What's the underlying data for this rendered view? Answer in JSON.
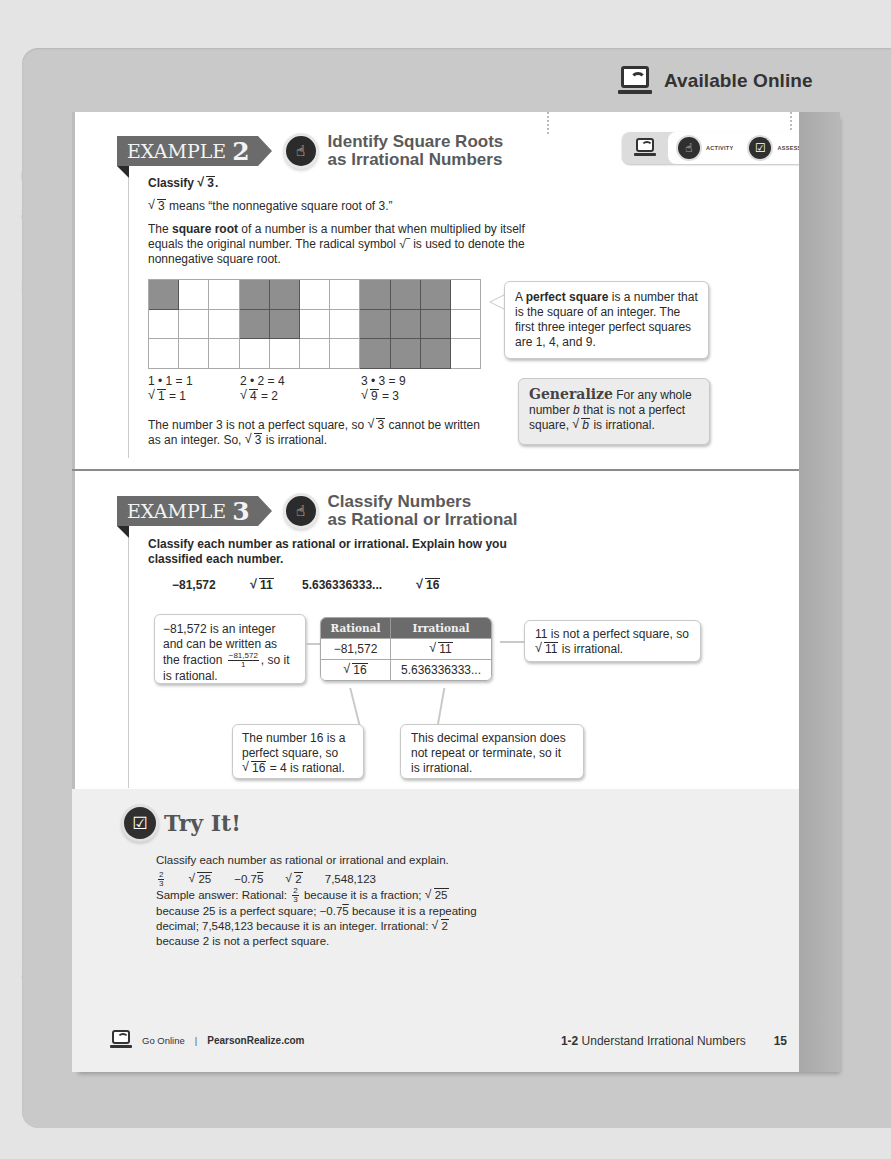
{
  "background_ghost_text": [
    "",
    "",
    "",
    "",
    "example a decimal place that does not terminate or repeat, the",
    "ample for any whole numbers that the following",
    "",
    "Understand Irrational Numbers",
    "",
    "",
    "",
    "",
    "",
    "",
    "",
    "",
    "",
    "",
    "",
    "",
    "",
    "",
    "",
    "",
    "",
    "Student Misconception",
    ""
  ],
  "header": {
    "available_online_label": "Available Online",
    "online_toolbar": {
      "items": [
        {
          "icon": "laptop-wifi-icon",
          "label": ""
        },
        {
          "icon": "hand-pointer-icon",
          "label": "ACTIVITY"
        },
        {
          "icon": "check-box-icon",
          "label": "ASSESS"
        }
      ]
    }
  },
  "example2": {
    "tag_word": "EXAMPLE",
    "tag_number": "2",
    "title_line1": "Identify Square Roots",
    "title_line2": "as Irrational Numbers",
    "prompt_pre": "Classify ",
    "prompt_rad": "3",
    "prompt_post": ".",
    "line1_rad": "3",
    "line1_post": " means “the nonnegative square root of 3.”",
    "def_pre": "The ",
    "def_term": "square root",
    "def_mid": " of a number is a number that when multiplied by itself equals the original number. The radical symbol ",
    "def_symbol": "√‾",
    "def_post": " is used to denote the nonnegative square root.",
    "grid": {
      "cols": 11,
      "rows": 3,
      "shaded": [
        [
          0,
          0
        ],
        [
          0,
          3
        ],
        [
          0,
          4
        ],
        [
          1,
          3
        ],
        [
          1,
          4
        ],
        [
          0,
          7
        ],
        [
          0,
          8
        ],
        [
          0,
          9
        ],
        [
          1,
          7
        ],
        [
          1,
          8
        ],
        [
          1,
          9
        ],
        [
          2,
          7
        ],
        [
          2,
          8
        ],
        [
          2,
          9
        ]
      ]
    },
    "products": [
      {
        "eq": "1 • 1 = 1",
        "rad": "1",
        "result": " = 1"
      },
      {
        "eq": "2 • 2 = 4",
        "rad": "4",
        "result": " = 2"
      },
      {
        "eq": "3 • 3 = 9",
        "rad": "9",
        "result": " = 3"
      }
    ],
    "conclusion_a": "The number 3 is not a perfect square, so ",
    "conclusion_rad1": "3",
    "conclusion_b": " cannot be written as an integer. So, ",
    "conclusion_rad2": "3",
    "conclusion_c": " is irrational.",
    "perfect_square_callout": {
      "pre": "A ",
      "term": "perfect square",
      "post": " is a number that is the square of an integer. The first three integer perfect squares are 1, 4, and 9."
    },
    "generalize_callout": {
      "word": "Generalize",
      "text_a": " For any whole number ",
      "var": "b",
      "text_b": " that is not a perfect square, ",
      "rad": "b",
      "text_c": " is irrational."
    }
  },
  "example3": {
    "tag_word": "EXAMPLE",
    "tag_number": "3",
    "title_line1": "Classify Numbers",
    "title_line2": "as Rational or Irrational",
    "prompt": "Classify each number as rational or irrational. Explain how you classified each number.",
    "numbers": {
      "n1": "−81,572",
      "n2_rad": "11",
      "n3": "5.636336333...",
      "n4_rad": "16"
    },
    "table": {
      "headers": [
        "Rational",
        "Irrational"
      ],
      "rows": [
        {
          "rational": "−81,572",
          "rational_is_rad": false,
          "irrational": "11",
          "irrational_is_rad": true
        },
        {
          "rational": "16",
          "rational_is_rad": true,
          "irrational": "5.636336333...",
          "irrational_is_rad": false
        }
      ]
    },
    "callout_integer": {
      "text_a": "−81,572 is an integer and can be written as the fraction ",
      "frac_num": "−81,572",
      "frac_den": "1",
      "text_b": ", so it is rational."
    },
    "callout_sqrt11": {
      "text_a": "11 is not a perfect square, so ",
      "rad": "11",
      "text_b": " is irrational."
    },
    "callout_sqrt16": {
      "text_a": "The number 16 is a perfect square, so ",
      "rad": "16",
      "text_b": " = 4 is rational."
    },
    "callout_decimal": {
      "text": "This decimal expansion does not repeat or terminate, so it is irrational."
    }
  },
  "try_it": {
    "title": "Try It!",
    "prompt": "Classify each number as rational or irrational and explain.",
    "items": {
      "frac_num": "2",
      "frac_den": "3",
      "rad1": "25",
      "dec_base": "−0.7",
      "dec_rep": "5",
      "rad2": "2",
      "int": "7,548,123"
    },
    "answer": {
      "a": "Sample answer: Rational: ",
      "frac_num": "2",
      "frac_den": "3",
      "b": " because it is a fraction; ",
      "rad1": "25",
      "c": " because 25 is a perfect square; ",
      "dec_base": "−0.7",
      "dec_rep": "5",
      "d": " because it is a repeating decimal; 7,548,123 because it is an integer. Irrational: ",
      "rad2": "2",
      "e": " because 2 is not a perfect square."
    }
  },
  "footer": {
    "go_online": "Go Online",
    "separator": "|",
    "site": "PearsonRealize.com",
    "lesson_number": "1-2",
    "lesson_title": "Understand Irrational Numbers",
    "page_number": "15"
  }
}
